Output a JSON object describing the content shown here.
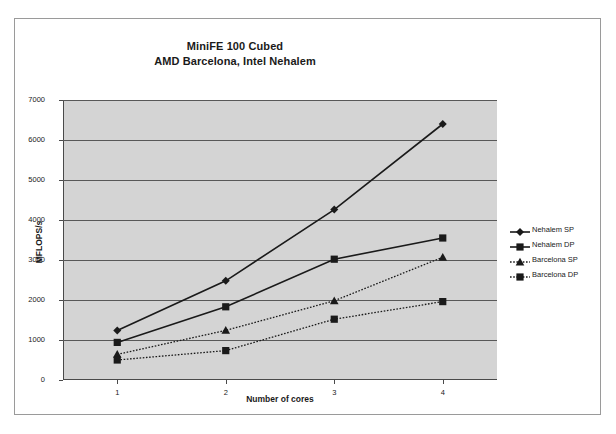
{
  "chart_data": {
    "type": "line",
    "title": "MiniFE 100 Cubed",
    "subtitle": "AMD Barcelona, Intel Nehalem",
    "xlabel": "Number of cores",
    "ylabel": "MFLOPS/s",
    "categories": [
      "1",
      "2",
      "3",
      "4"
    ],
    "ylim": [
      0,
      7000
    ],
    "ytick_labels": [
      "0",
      "1000",
      "2000",
      "3000",
      "4000",
      "5000",
      "6000",
      "7000"
    ],
    "ytick_values": [
      0,
      1000,
      2000,
      3000,
      4000,
      5000,
      6000,
      7000
    ],
    "grid": true,
    "legend_position": "right",
    "series": [
      {
        "name": "Nehalem SP",
        "marker": "diamond",
        "line_style": "solid",
        "color": "#1a1a1a",
        "values": [
          1240,
          2480,
          4260,
          6400
        ]
      },
      {
        "name": "Nehalem DP",
        "marker": "square",
        "line_style": "solid",
        "color": "#1a1a1a",
        "values": [
          940,
          1830,
          3020,
          3550
        ]
      },
      {
        "name": "Barcelona SP",
        "marker": "triangle",
        "line_style": "dotted",
        "color": "#1a1a1a",
        "values": [
          640,
          1240,
          1980,
          3070
        ]
      },
      {
        "name": "Barcelona DP",
        "marker": "square",
        "line_style": "dotted",
        "color": "#1a1a1a",
        "values": [
          500,
          735,
          1520,
          1960
        ]
      }
    ]
  },
  "style": {
    "plot_background": "#d4d4d4",
    "page_background": "#ffffff",
    "gridline_color": "#585858",
    "axis_color": "#4a4a4a",
    "text_color": "#1a1a1a"
  }
}
